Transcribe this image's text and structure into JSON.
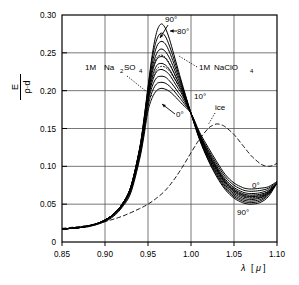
{
  "chart_data": {
    "type": "line",
    "title": "",
    "xlabel": "λ [μ]",
    "ylabel": "E / (ρ·d)",
    "ylabel_parts": {
      "numerator": "E",
      "denominator": "ρ·d"
    },
    "xlim": [
      0.85,
      1.1
    ],
    "ylim": [
      0.0,
      0.3
    ],
    "xticks": [
      0.85,
      0.9,
      0.95,
      1.0,
      1.05,
      1.1
    ],
    "xtick_labels": [
      "0.85",
      "0.90",
      "0.95",
      "1.00",
      "1.05",
      "1.10"
    ],
    "yticks": [
      0.0,
      0.05,
      0.1,
      0.15,
      0.2,
      0.25,
      0.3
    ],
    "ytick_labels": [
      "0",
      "0.05",
      "0.10",
      "0.15",
      "0.20",
      "0.25",
      "0.30"
    ],
    "grid": true,
    "legend_position": "inline-annotations",
    "x": [
      0.85,
      0.86,
      0.87,
      0.88,
      0.89,
      0.9,
      0.91,
      0.92,
      0.93,
      0.94,
      0.945,
      0.95,
      0.955,
      0.96,
      0.965,
      0.97,
      0.975,
      0.98,
      0.985,
      0.99,
      1.0,
      1.01,
      1.02,
      1.03,
      1.04,
      1.05,
      1.06,
      1.065,
      1.07,
      1.08,
      1.09,
      1.1
    ],
    "series": [
      {
        "name": "90°",
        "style": "solid",
        "temperature_deg": 90,
        "values": [
          0.017,
          0.018,
          0.019,
          0.021,
          0.024,
          0.029,
          0.037,
          0.05,
          0.073,
          0.122,
          0.16,
          0.205,
          0.248,
          0.277,
          0.288,
          0.283,
          0.268,
          0.248,
          0.228,
          0.208,
          0.17,
          0.135,
          0.108,
          0.086,
          0.069,
          0.058,
          0.052,
          0.0505,
          0.05,
          0.052,
          0.06,
          0.078
        ]
      },
      {
        "name": "80°",
        "style": "solid",
        "temperature_deg": 80,
        "values": [
          0.017,
          0.018,
          0.019,
          0.021,
          0.024,
          0.029,
          0.037,
          0.05,
          0.073,
          0.122,
          0.159,
          0.203,
          0.243,
          0.267,
          0.276,
          0.272,
          0.259,
          0.242,
          0.224,
          0.206,
          0.17,
          0.136,
          0.109,
          0.088,
          0.071,
          0.06,
          0.054,
          0.0525,
          0.052,
          0.054,
          0.062,
          0.078
        ]
      },
      {
        "name": "70°",
        "style": "solid",
        "temperature_deg": 70,
        "values": [
          0.017,
          0.018,
          0.019,
          0.021,
          0.024,
          0.029,
          0.037,
          0.05,
          0.073,
          0.121,
          0.157,
          0.2,
          0.236,
          0.258,
          0.265,
          0.262,
          0.251,
          0.236,
          0.22,
          0.204,
          0.17,
          0.137,
          0.111,
          0.09,
          0.073,
          0.062,
          0.056,
          0.0545,
          0.054,
          0.056,
          0.063,
          0.078
        ]
      },
      {
        "name": "60°",
        "style": "solid",
        "temperature_deg": 60,
        "values": [
          0.017,
          0.018,
          0.019,
          0.021,
          0.024,
          0.029,
          0.037,
          0.05,
          0.072,
          0.12,
          0.155,
          0.197,
          0.23,
          0.249,
          0.255,
          0.252,
          0.243,
          0.23,
          0.216,
          0.202,
          0.17,
          0.138,
          0.112,
          0.092,
          0.075,
          0.064,
          0.058,
          0.0565,
          0.056,
          0.058,
          0.064,
          0.078
        ]
      },
      {
        "name": "50°",
        "style": "solid",
        "temperature_deg": 50,
        "values": [
          0.017,
          0.018,
          0.019,
          0.021,
          0.024,
          0.029,
          0.037,
          0.05,
          0.072,
          0.119,
          0.153,
          0.194,
          0.224,
          0.241,
          0.245,
          0.243,
          0.235,
          0.224,
          0.212,
          0.2,
          0.17,
          0.139,
          0.114,
          0.094,
          0.077,
          0.066,
          0.06,
          0.0585,
          0.058,
          0.059,
          0.065,
          0.078
        ]
      },
      {
        "name": "40°",
        "style": "solid",
        "temperature_deg": 40,
        "values": [
          0.017,
          0.018,
          0.019,
          0.021,
          0.024,
          0.029,
          0.037,
          0.049,
          0.071,
          0.118,
          0.151,
          0.191,
          0.218,
          0.233,
          0.236,
          0.234,
          0.228,
          0.218,
          0.208,
          0.197,
          0.17,
          0.14,
          0.116,
          0.096,
          0.079,
          0.068,
          0.062,
          0.0605,
          0.06,
          0.061,
          0.066,
          0.078
        ]
      },
      {
        "name": "30°",
        "style": "solid",
        "temperature_deg": 30,
        "values": [
          0.017,
          0.018,
          0.019,
          0.021,
          0.024,
          0.029,
          0.036,
          0.049,
          0.07,
          0.116,
          0.149,
          0.188,
          0.212,
          0.225,
          0.228,
          0.226,
          0.221,
          0.212,
          0.203,
          0.194,
          0.17,
          0.141,
          0.118,
          0.098,
          0.081,
          0.07,
          0.064,
          0.0625,
          0.062,
          0.063,
          0.067,
          0.078
        ]
      },
      {
        "name": "20°",
        "style": "solid",
        "temperature_deg": 20,
        "values": [
          0.017,
          0.018,
          0.019,
          0.021,
          0.024,
          0.028,
          0.036,
          0.048,
          0.069,
          0.114,
          0.146,
          0.184,
          0.206,
          0.217,
          0.219,
          0.218,
          0.213,
          0.206,
          0.198,
          0.19,
          0.17,
          0.142,
          0.12,
          0.1,
          0.083,
          0.072,
          0.066,
          0.0645,
          0.064,
          0.065,
          0.069,
          0.078
        ]
      },
      {
        "name": "10°",
        "style": "solid",
        "temperature_deg": 10,
        "values": [
          0.017,
          0.018,
          0.019,
          0.021,
          0.023,
          0.028,
          0.035,
          0.047,
          0.067,
          0.111,
          0.142,
          0.179,
          0.199,
          0.209,
          0.211,
          0.21,
          0.206,
          0.2,
          0.193,
          0.186,
          0.17,
          0.143,
          0.122,
          0.103,
          0.086,
          0.075,
          0.069,
          0.0675,
          0.067,
          0.068,
          0.071,
          0.079
        ]
      },
      {
        "name": "0°",
        "style": "solid",
        "temperature_deg": 0,
        "values": [
          0.017,
          0.018,
          0.019,
          0.02,
          0.023,
          0.027,
          0.034,
          0.046,
          0.065,
          0.108,
          0.138,
          0.173,
          0.191,
          0.2,
          0.203,
          0.202,
          0.199,
          0.194,
          0.188,
          0.182,
          0.17,
          0.145,
          0.125,
          0.106,
          0.089,
          0.078,
          0.072,
          0.0705,
          0.07,
          0.071,
          0.073,
          0.08
        ]
      },
      {
        "name": "1M Na2SO4",
        "style": "dotted",
        "values": [
          0.017,
          0.018,
          0.019,
          0.021,
          0.024,
          0.029,
          0.037,
          0.05,
          0.073,
          0.12,
          0.155,
          0.196,
          0.227,
          0.243,
          0.247,
          0.244,
          0.236,
          0.224,
          0.211,
          0.199,
          0.17,
          0.14,
          0.115,
          0.095,
          0.078,
          0.067,
          0.061,
          0.0595,
          0.059,
          0.06,
          0.065,
          0.078
        ]
      },
      {
        "name": "1M NaClO4",
        "style": "dotted",
        "values": [
          0.017,
          0.018,
          0.019,
          0.021,
          0.024,
          0.029,
          0.037,
          0.049,
          0.071,
          0.117,
          0.15,
          0.189,
          0.214,
          0.228,
          0.232,
          0.231,
          0.226,
          0.217,
          0.207,
          0.196,
          0.17,
          0.141,
          0.117,
          0.097,
          0.08,
          0.069,
          0.063,
          0.0615,
          0.061,
          0.062,
          0.067,
          0.078
        ]
      },
      {
        "name": "ice",
        "style": "dashed",
        "x": [
          0.85,
          0.88,
          0.9,
          0.92,
          0.94,
          0.95,
          0.96,
          0.97,
          0.98,
          0.99,
          1.0,
          1.01,
          1.02,
          1.025,
          1.03,
          1.035,
          1.04,
          1.05,
          1.06,
          1.07,
          1.08,
          1.085,
          1.09,
          1.095,
          1.1
        ],
        "values": [
          0.018,
          0.022,
          0.027,
          0.034,
          0.044,
          0.05,
          0.058,
          0.068,
          0.082,
          0.099,
          0.118,
          0.136,
          0.15,
          0.154,
          0.156,
          0.155,
          0.152,
          0.142,
          0.128,
          0.114,
          0.104,
          0.101,
          0.1,
          0.101,
          0.104
        ]
      }
    ],
    "annotations": [
      {
        "id": "ann-90-top",
        "text": "90°",
        "x": 0.973,
        "y": 0.296,
        "leader": true
      },
      {
        "id": "ann-80-top",
        "text": "80°",
        "x": 0.984,
        "y": 0.281,
        "leader": true
      },
      {
        "id": "ann-na2so4",
        "text": "1M  Na₂SO₄",
        "x": 0.908,
        "y": 0.228,
        "leader": true
      },
      {
        "id": "ann-naclo4",
        "text": "1M NaClO₄",
        "x": 1.012,
        "y": 0.228,
        "leader": true
      },
      {
        "id": "ann-10",
        "text": "10°",
        "x": 0.998,
        "y": 0.196,
        "leader": false
      },
      {
        "id": "ann-0-left",
        "text": "0°",
        "x": 0.985,
        "y": 0.173,
        "leader": true
      },
      {
        "id": "ann-ice",
        "text": "ice",
        "x": 1.035,
        "y": 0.184,
        "leader": true
      },
      {
        "id": "ann-0-right",
        "text": "0°",
        "x": 1.077,
        "y": 0.073,
        "leader": false
      },
      {
        "id": "ann-90-bottom",
        "text": "90°",
        "x": 1.068,
        "y": 0.038,
        "leader": false
      }
    ]
  },
  "labels": {
    "na2so4": {
      "prefix": "1M",
      "main": "Na",
      "sub1": "2",
      "mid": "SO",
      "sub2": "4"
    },
    "naclo4": {
      "prefix": "1M",
      "main": "NaClO",
      "sub": "4"
    },
    "ice": "ice",
    "deg90_top": "90°",
    "deg80_top": "80°",
    "deg10": "10°",
    "deg0_left": "0°",
    "deg0_right": "0°",
    "deg90_bottom": "90°",
    "xaxis": {
      "lambda": "λ",
      "unit_open": "[",
      "unit": "μ",
      "unit_close": "]"
    },
    "yaxis": {
      "numerator": "E",
      "denominator": "ρ·d"
    }
  },
  "colors": {
    "curve": "#000000",
    "grid": "#555555",
    "axis": "#000000",
    "background": "#ffffff"
  }
}
